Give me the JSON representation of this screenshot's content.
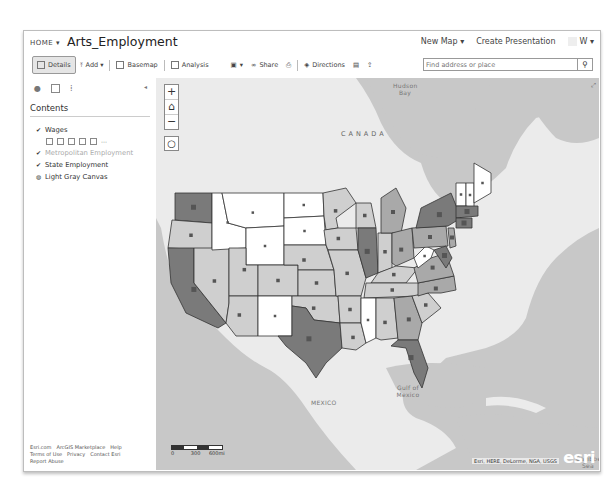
{
  "header": {
    "home_label": "HOME ▾",
    "title": "Arts_Employment",
    "new_map": "New Map ▾",
    "create_presentation": "Create Presentation",
    "user": "W ▾"
  },
  "toolbar": {
    "details": "Details",
    "add": "Add ▾",
    "basemap": "Basemap",
    "analysis": "Analysis",
    "save": "▾",
    "share": "Share",
    "directions": "Directions"
  },
  "search": {
    "placeholder": "Find address or place",
    "button_icon": "search-icon"
  },
  "panel": {
    "contents_title": "Contents",
    "layers": [
      {
        "label": "Wages",
        "checked": true,
        "dim": false
      },
      {
        "label": "Metropolitan Employment",
        "checked": true,
        "dim": true
      },
      {
        "label": "State Employment",
        "checked": true,
        "dim": false
      },
      {
        "label": "Light Gray Canvas",
        "checked": false,
        "dim": false
      }
    ],
    "footer_links": [
      "Esri.com",
      "ArcGIS Marketplace",
      "Help",
      "Terms of Use",
      "Privacy",
      "Contact Esri",
      "Report Abuse"
    ]
  },
  "map": {
    "labels": {
      "canada": "CANADA",
      "hudson_bay": "Hudson Bay",
      "mexico": "MEXICO",
      "gulf": "Gulf of Mexico",
      "caribbean": "Caribbean Sea"
    },
    "scale": {
      "zero": "0",
      "mid": "300",
      "end": "600mi"
    },
    "attribution": "Esri, HERE, DeLorme, NGA, USGS",
    "logo": "esri",
    "colors": {
      "water": "#c8c8c8",
      "land": "#ebebeb",
      "class1": "#ffffff",
      "class2": "#cfcfcf",
      "class3": "#a9a9a9",
      "class4": "#7a7a7a",
      "border": "#333333",
      "marker": "#555555"
    }
  }
}
